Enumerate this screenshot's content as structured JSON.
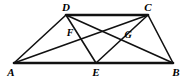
{
  "figure": {
    "type": "geometry-diagram",
    "shape": "trapezoid-with-cevians",
    "canvas": {
      "width": 190,
      "height": 79
    },
    "stroke_color": "#111111",
    "background_color": "#ffffff",
    "thick_stroke_width": 2.6,
    "thin_stroke_width": 1.6,
    "points": {
      "A": {
        "label": "A",
        "x": 14,
        "y": 63,
        "label_x": 11,
        "label_y": 72,
        "kind": "vertex"
      },
      "B": {
        "label": "B",
        "x": 173,
        "y": 63,
        "label_x": 176,
        "label_y": 72,
        "kind": "vertex"
      },
      "C": {
        "label": "C",
        "x": 148,
        "y": 15,
        "label_x": 148,
        "label_y": 7,
        "kind": "vertex"
      },
      "D": {
        "label": "D",
        "x": 66,
        "y": 15,
        "label_x": 66,
        "label_y": 7,
        "kind": "vertex"
      },
      "E": {
        "label": "E",
        "x": 96,
        "y": 63,
        "label_x": 96,
        "label_y": 72,
        "kind": "point-on-segment-AB"
      },
      "F": {
        "label": "F",
        "x": 78,
        "y": 38,
        "label_x": 70,
        "label_y": 33,
        "kind": "intersection-AC-DE"
      },
      "G": {
        "label": "G",
        "x": 133,
        "y": 41,
        "label_x": 128,
        "label_y": 35,
        "kind": "intersection-DB-CE"
      }
    },
    "segments": [
      {
        "name": "base-AB",
        "from": "A",
        "to": "B",
        "weight": "thick"
      },
      {
        "name": "top-DC",
        "from": "D",
        "to": "C",
        "weight": "thick"
      },
      {
        "name": "side-AD",
        "from": "A",
        "to": "D",
        "weight": "thin"
      },
      {
        "name": "side-CB",
        "from": "C",
        "to": "B",
        "weight": "thin"
      },
      {
        "name": "diagonal-AC",
        "from": "A",
        "to": "C",
        "weight": "thin"
      },
      {
        "name": "diagonal-DB",
        "from": "D",
        "to": "B",
        "weight": "thin"
      },
      {
        "name": "cevian-DE",
        "from": "D",
        "to": "E",
        "weight": "thin"
      },
      {
        "name": "cevian-CE",
        "from": "C",
        "to": "E",
        "weight": "thin"
      }
    ],
    "labels_order": [
      "D",
      "C",
      "F",
      "G",
      "A",
      "E",
      "B"
    ]
  }
}
